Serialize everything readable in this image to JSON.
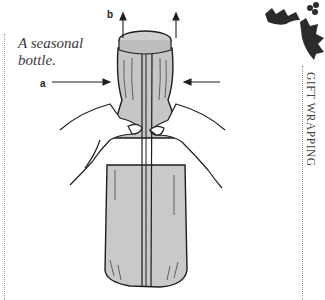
{
  "page": {
    "caption": "A seasonal bottle.",
    "section_title": "GIFT WRAPPING"
  },
  "illustration": {
    "labels": {
      "a": "a",
      "b": "b"
    },
    "description": "Hands gathering paper around the neck of a wrapped bottle; arrows show pushing in (a) and pulling up (b)",
    "colors": {
      "paper": "#c8c8c8",
      "ink": "#1e1e1e",
      "holly": "#2b2b2b"
    }
  },
  "decoration": {
    "icon": "holly-leaf-icon"
  }
}
